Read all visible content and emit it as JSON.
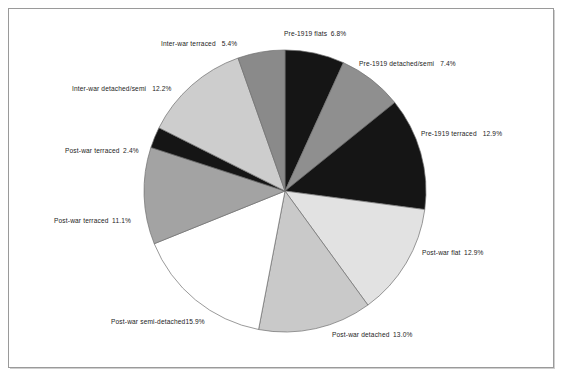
{
  "figure": {
    "kind": "pie-chart",
    "background_color": "#ffffff",
    "frame_color": "#9a9a9a"
  },
  "chart_data": {
    "type": "pie",
    "title": "",
    "subtitle": "",
    "xlabel": "",
    "ylabel": "",
    "legend_position": "none",
    "grid": false,
    "label_format": "name + percent",
    "start_angle_deg": 0,
    "direction": "clockwise",
    "total_percent": 100.0,
    "categories": [
      "Pre-1919 flats",
      "Pre-1919 detached/semi",
      "Pre-1919 terraced",
      "Post-war flat",
      "Post-war detached",
      "Post-war semi-detached",
      "Post-war terraced",
      "Post-war terraced",
      "Inter-war detached/semi",
      "Inter-war terraced"
    ],
    "values": [
      6.8,
      7.4,
      12.9,
      12.9,
      13.0,
      15.9,
      11.1,
      2.4,
      12.2,
      5.4
    ],
    "value_labels": [
      "6.8%",
      "7.4%",
      "12.9%",
      "12.9%",
      "13.0%",
      "15.9%",
      "11.1%",
      "2.4%",
      "12.2%",
      "5.4%"
    ],
    "slice_fills": [
      "#151515",
      "#8f8f8f",
      "#151515",
      "#e2e2e2",
      "#c9c9c9",
      "#ffffff",
      "#a3a3a3",
      "#151515",
      "#cdcdcd",
      "#8a8a8a"
    ],
    "slices": [
      {
        "label": "Pre-1919 flats",
        "value": 6.8,
        "value_label": "6.8%",
        "fill": "#151515"
      },
      {
        "label": "Pre-1919 detached/semi",
        "value": 7.4,
        "value_label": "7.4%",
        "fill": "#8f8f8f"
      },
      {
        "label": "Pre-1919 terraced",
        "value": 12.9,
        "value_label": "12.9%",
        "fill": "#151515"
      },
      {
        "label": "Post-war flat",
        "value": 12.9,
        "value_label": "12.9%",
        "fill": "#e2e2e2"
      },
      {
        "label": "Post-war detached",
        "value": 13.0,
        "value_label": "13.0%",
        "fill": "#c9c9c9"
      },
      {
        "label": "Post-war semi-detached",
        "value": 15.9,
        "value_label": "15.9%",
        "fill": "#ffffff"
      },
      {
        "label": "Post-war terraced",
        "value": 11.1,
        "value_label": "11.1%",
        "fill": "#a3a3a3"
      },
      {
        "label": "Post-war terraced",
        "value": 2.4,
        "value_label": "2.4%",
        "fill": "#151515"
      },
      {
        "label": "Inter-war detached/semi",
        "value": 12.2,
        "value_label": "12.2%",
        "fill": "#cdcdcd"
      },
      {
        "label": "Inter-war terraced",
        "value": 5.4,
        "value_label": "5.4%",
        "fill": "#8a8a8a"
      }
    ]
  },
  "labels": {
    "pre_1919_flats": {
      "name": "Pre-1919 flats",
      "value": "6.8%"
    },
    "pre_1919_detached_semi": {
      "name": "Pre-1919 detached/semi",
      "value": "7.4%"
    },
    "pre_1919_terraced": {
      "name": "Pre-1919 terraced",
      "value": "12.9%"
    },
    "post_war_flat": {
      "name": "Post-war flat",
      "value": "12.9%"
    },
    "post_war_detached": {
      "name": "Post-war detached",
      "value": "13.0%"
    },
    "post_war_semi_detached": {
      "name": "Post-war semi-detached",
      "value": "15.9%"
    },
    "post_war_terraced_11": {
      "name": "Post-war terraced",
      "value": "11.1%"
    },
    "post_war_terraced_2": {
      "name": "Post-war terraced",
      "value": "2.4%"
    },
    "inter_war_detached_semi": {
      "name": "Inter-war detached/semi",
      "value": "12.2%"
    },
    "inter_war_terraced": {
      "name": "Inter-war terraced",
      "value": "5.4%"
    }
  }
}
